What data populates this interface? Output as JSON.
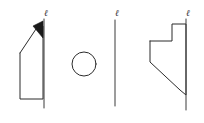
{
  "figure": {
    "background_color": "#ffffff",
    "stroke_color": "#2b2b2b",
    "fill_color": "#1a1a1a",
    "width": 204,
    "height": 123,
    "views": [
      {
        "id": "view-left",
        "name": "profile-with-pointed-cap",
        "axis_label": "ℓ",
        "axis_label_x": 44,
        "axis_label_y": 16,
        "axis_line_x": 44,
        "axis_line_top": 19,
        "axis_line_bottom": 108,
        "outline_points": "20,53 38,26 43,26 43,99 20,99 20,53",
        "filled_cap_points": "33,26 43,21 43,38 33,26",
        "has_filled_cap": true
      },
      {
        "id": "view-middle-circle",
        "name": "circular-top-view",
        "axis_label": "",
        "circle_cx": 84,
        "circle_cy": 64,
        "circle_r": 12
      },
      {
        "id": "view-middle-line",
        "name": "axis-only-view",
        "axis_label": "ℓ",
        "axis_label_x": 115,
        "axis_label_y": 16,
        "axis_line_x": 115,
        "axis_line_top": 20,
        "axis_line_bottom": 106
      },
      {
        "id": "view-right",
        "name": "stepped-profile",
        "axis_label": "ℓ",
        "axis_label_x": 186,
        "axis_label_y": 16,
        "axis_line_x": 186,
        "axis_line_top": 19,
        "axis_line_bottom": 110,
        "outline_points": "150,41 172,41 172,24 186,24 186,95 180,90 150,62 150,41"
      }
    ]
  }
}
